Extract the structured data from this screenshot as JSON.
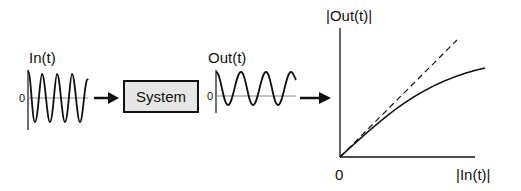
{
  "input": {
    "label": "In(t)",
    "zero": "0",
    "cycles": 4
  },
  "system": {
    "label": "System"
  },
  "output": {
    "label": "Out(t)",
    "zero": "0",
    "cycles": 3.5
  },
  "plot": {
    "y_label": "|Out(t)|",
    "x_label": "|In(t)|",
    "origin_label": "0",
    "series": [
      {
        "name": "linear",
        "style": "dashed"
      },
      {
        "name": "saturating",
        "style": "solid"
      }
    ]
  },
  "colors": {
    "line": "#111111",
    "box_fill": "#e6e6e6",
    "baseline": "#888888"
  }
}
